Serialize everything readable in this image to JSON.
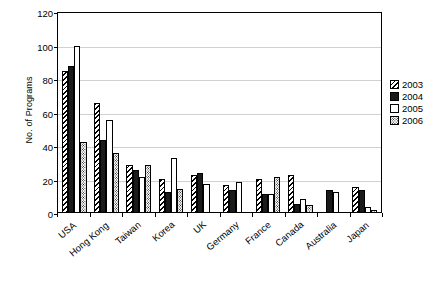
{
  "chart_data": {
    "type": "bar",
    "title": "",
    "xlabel": "",
    "ylabel": "No. of Programs",
    "ylim": [
      0,
      120
    ],
    "ytick_step": 20,
    "yticks": [
      0,
      20,
      40,
      60,
      80,
      100,
      120
    ],
    "grid": true,
    "legend_position": "right",
    "categories": [
      "USA",
      "Hong Kong",
      "Taiwan",
      "Korea",
      "UK",
      "Germany",
      "France",
      "Canada",
      "Australia",
      "Japan"
    ],
    "series": [
      {
        "name": "2003",
        "pattern": "diagonal-hatch",
        "values": [
          84,
          65,
          28,
          20,
          22,
          16,
          20,
          22,
          0,
          15
        ]
      },
      {
        "name": "2004",
        "pattern": "solid-black",
        "values": [
          87,
          43,
          25,
          12,
          23,
          13,
          11,
          5,
          13,
          13
        ]
      },
      {
        "name": "2005",
        "pattern": "white",
        "values": [
          99,
          55,
          21,
          32,
          17,
          18,
          11,
          8,
          12,
          3
        ]
      },
      {
        "name": "2006",
        "pattern": "dotted",
        "values": [
          42,
          35,
          28,
          14,
          0,
          0,
          21,
          4,
          0,
          1
        ]
      }
    ]
  },
  "legend": {
    "entries": [
      "2003",
      "2004",
      "2005",
      "2006"
    ]
  }
}
